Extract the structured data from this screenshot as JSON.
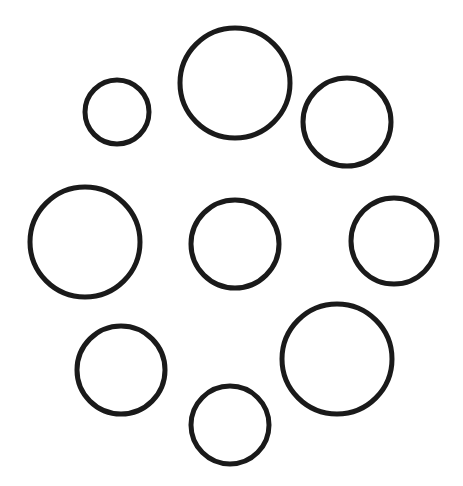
{
  "diagram": {
    "background_color": "#ffffff",
    "stroke_color": "#1a1a1a",
    "circles": [
      {
        "id": "top-left-small",
        "size": "small"
      },
      {
        "id": "top-large",
        "size": "large"
      },
      {
        "id": "top-right-medium",
        "size": "medium"
      },
      {
        "id": "left-large",
        "size": "large"
      },
      {
        "id": "center-medium",
        "size": "medium"
      },
      {
        "id": "right-medium",
        "size": "medium"
      },
      {
        "id": "bottom-left-medium",
        "size": "medium"
      },
      {
        "id": "bottom-right-large",
        "size": "large"
      },
      {
        "id": "bottom-small",
        "size": "small"
      }
    ]
  }
}
